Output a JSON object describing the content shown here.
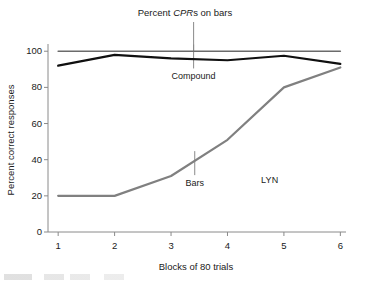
{
  "chart_data": {
    "type": "line",
    "title": "Percent CPRs on bars",
    "title_parts": {
      "pre": "Percent ",
      "italic": "CPR",
      "post": "s on bars"
    },
    "xlabel": "Blocks of 80 trials",
    "ylabel": "Percent correct responses",
    "x": [
      1,
      2,
      3,
      4,
      5,
      6
    ],
    "xlim": [
      0.82,
      6.1
    ],
    "ylim": [
      0,
      104
    ],
    "xticks": [
      "1",
      "2",
      "3",
      "4",
      "5",
      "6"
    ],
    "yticks": [
      "0",
      "20",
      "40",
      "60",
      "80",
      "100"
    ],
    "ytick_values": [
      0,
      20,
      40,
      60,
      80,
      100
    ],
    "grid": false,
    "legend_position": "inline-annotations",
    "series": [
      {
        "name": "Percent CPRs on bars",
        "color": "#6b6b6b",
        "width": 1.6,
        "values": [
          100,
          100,
          100,
          100,
          100,
          100
        ]
      },
      {
        "name": "Compound",
        "color": "#101010",
        "width": 2.2,
        "values": [
          92,
          98,
          96,
          95,
          97.5,
          93
        ]
      },
      {
        "name": "Bars",
        "color": "#808080",
        "width": 2.2,
        "values": [
          20,
          20,
          31,
          51,
          80,
          91
        ]
      }
    ],
    "annotations": [
      {
        "label": "Compound",
        "x": 3.4,
        "y": 96,
        "leader": true
      },
      {
        "label": "Bars",
        "x": 3.42,
        "y": 37,
        "leader": true
      },
      {
        "label": "LYN",
        "x": 4.75,
        "y": 29,
        "leader": false
      }
    ]
  }
}
